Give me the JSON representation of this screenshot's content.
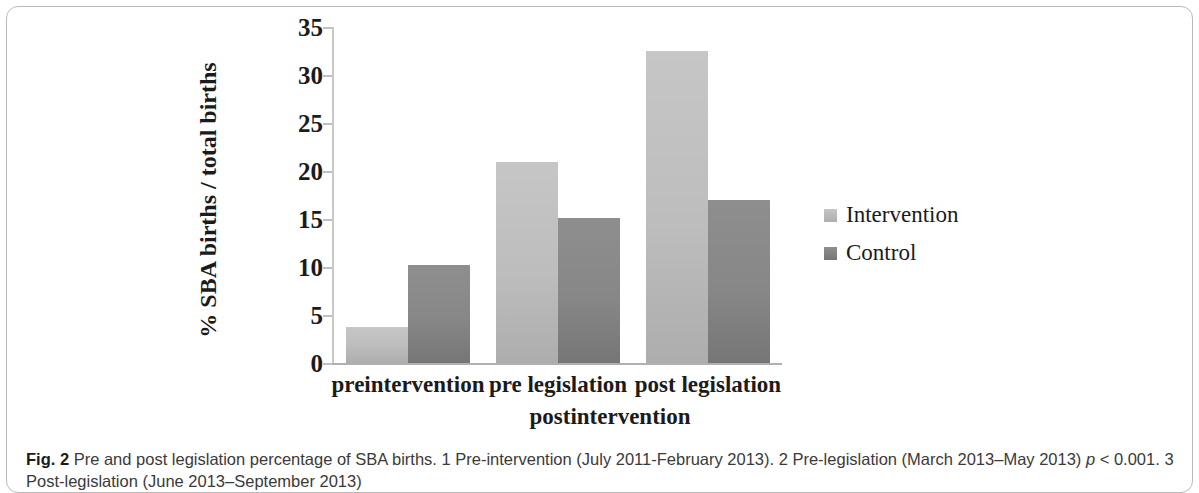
{
  "figure": {
    "caption_prefix": "Fig. 2",
    "caption_text": " Pre and post legislation percentage of SBA births. 1 Pre-intervention (July 2011-February 2013). 2 Pre-legislation (March 2013–May 2013) ",
    "caption_pvalue_italic": "p",
    "caption_pvalue_rest": " < 0.001. 3 Post-legislation (June 2013–September 2013)"
  },
  "chart_data": {
    "type": "bar",
    "title": "",
    "xlabel": "postintervention",
    "ylabel": "% SBA births / total births",
    "categories": [
      "preintervention",
      "pre legislation",
      "post legislation"
    ],
    "series": [
      {
        "name": "Intervention",
        "values": [
          3.7,
          20.9,
          32.5
        ],
        "color": "#bdbdbd"
      },
      {
        "name": "Control",
        "values": [
          10.2,
          15.1,
          17.0
        ],
        "color": "#878787"
      }
    ],
    "ylim": [
      0,
      35
    ],
    "yticks": [
      0,
      5,
      10,
      15,
      20,
      25,
      30,
      35
    ],
    "ytick_labels": [
      "0",
      "5",
      "10",
      "15",
      "20",
      "25",
      "30",
      "35"
    ],
    "grid": false,
    "legend_position": "right"
  }
}
